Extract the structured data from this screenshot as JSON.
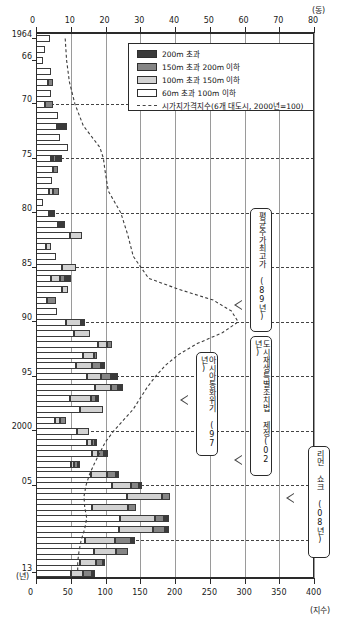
{
  "chart_data": {
    "type": "bar",
    "orientation": "horizontal",
    "title": "",
    "subtitle": "",
    "top_axis": {
      "label": "(동)",
      "ticks": [
        0,
        10,
        20,
        30,
        40,
        50,
        60,
        70,
        80
      ],
      "min": 0,
      "max": 80
    },
    "bottom_axis": {
      "label": "(지수)",
      "ticks": [
        0,
        50,
        100,
        150,
        200,
        250,
        300,
        350,
        400
      ],
      "min": 0,
      "max": 400
    },
    "ylabel": "(년)",
    "y_tick_labels": [
      "1964",
      "66",
      "70",
      "75",
      "80",
      "85",
      "90",
      "95",
      "2000",
      "05",
      "13"
    ],
    "grid": true,
    "legend_position": "top-right",
    "series": [
      {
        "name": "200m 초과",
        "key": "over200",
        "color": "#3a3a3a"
      },
      {
        "name": "150m 초과 200m 이하",
        "key": "m150_200",
        "color": "#858585"
      },
      {
        "name": "100m 초과 150m 이하",
        "key": "m100_150",
        "color": "#d2d2d2"
      },
      {
        "name": "60m 초과 100m 이하",
        "key": "m60_100",
        "color": "#ffffff"
      }
    ],
    "line_series": {
      "name": "시가지가격지수(6개 대도시, 2000년=100)",
      "style": "dashed",
      "axis": "bottom",
      "points": [
        {
          "year": 1964,
          "value": 42
        },
        {
          "year": 1966,
          "value": 44
        },
        {
          "year": 1968,
          "value": 48
        },
        {
          "year": 1970,
          "value": 56
        },
        {
          "year": 1972,
          "value": 68
        },
        {
          "year": 1974,
          "value": 92
        },
        {
          "year": 1975,
          "value": 97
        },
        {
          "year": 1976,
          "value": 99
        },
        {
          "year": 1978,
          "value": 104
        },
        {
          "year": 1980,
          "value": 122
        },
        {
          "year": 1982,
          "value": 132
        },
        {
          "year": 1984,
          "value": 140
        },
        {
          "year": 1986,
          "value": 162
        },
        {
          "year": 1987,
          "value": 205
        },
        {
          "year": 1988,
          "value": 255
        },
        {
          "year": 1989,
          "value": 281
        },
        {
          "year": 1990,
          "value": 291
        },
        {
          "year": 1991,
          "value": 268
        },
        {
          "year": 1992,
          "value": 232
        },
        {
          "year": 1993,
          "value": 205
        },
        {
          "year": 1994,
          "value": 186
        },
        {
          "year": 1995,
          "value": 172
        },
        {
          "year": 1996,
          "value": 160
        },
        {
          "year": 1997,
          "value": 150
        },
        {
          "year": 1998,
          "value": 140
        },
        {
          "year": 1999,
          "value": 126
        },
        {
          "year": 2000,
          "value": 112
        },
        {
          "year": 2001,
          "value": 100
        },
        {
          "year": 2002,
          "value": 92
        },
        {
          "year": 2003,
          "value": 84
        },
        {
          "year": 2004,
          "value": 77
        },
        {
          "year": 2005,
          "value": 72
        },
        {
          "year": 2006,
          "value": 69
        },
        {
          "year": 2007,
          "value": 70
        },
        {
          "year": 2008,
          "value": 73
        },
        {
          "year": 2009,
          "value": 70
        },
        {
          "year": 2010,
          "value": 65
        },
        {
          "year": 2011,
          "value": 62
        },
        {
          "year": 2012,
          "value": 60
        },
        {
          "year": 2013,
          "value": 60
        }
      ]
    },
    "categories": [
      1964,
      1965,
      1966,
      1967,
      1968,
      1969,
      1970,
      1971,
      1972,
      1973,
      1974,
      1975,
      1976,
      1977,
      1978,
      1979,
      1980,
      1981,
      1982,
      1983,
      1984,
      1985,
      1986,
      1987,
      1988,
      1989,
      1990,
      1991,
      1992,
      1993,
      1994,
      1995,
      1996,
      1997,
      1998,
      1999,
      2000,
      2001,
      2002,
      2003,
      2004,
      2005,
      2006,
      2007,
      2008,
      2009,
      2010,
      2011,
      2012,
      2013
    ],
    "rows": [
      {
        "year": 1964,
        "m60_100": 4.0,
        "m100_150": 0.0,
        "m150_200": 0.0,
        "over200": 0.0
      },
      {
        "year": 1965,
        "m60_100": 2.6,
        "m100_150": 0.0,
        "m150_200": 0.0,
        "over200": 0.0
      },
      {
        "year": 1966,
        "m60_100": 2.0,
        "m100_150": 0.0,
        "m150_200": 0.0,
        "over200": 0.0
      },
      {
        "year": 1967,
        "m60_100": 4.2,
        "m100_150": 0.0,
        "m150_200": 0.0,
        "over200": 0.0
      },
      {
        "year": 1968,
        "m60_100": 3.4,
        "m100_150": 0.0,
        "m150_200": 1.6,
        "over200": 0.0
      },
      {
        "year": 1969,
        "m60_100": 4.2,
        "m100_150": 0.0,
        "m150_200": 0.0,
        "over200": 0.0
      },
      {
        "year": 1970,
        "m60_100": 2.6,
        "m100_150": 0.0,
        "m150_200": 2.4,
        "over200": 0.0
      },
      {
        "year": 1971,
        "m60_100": 6.4,
        "m100_150": 0.0,
        "m150_200": 0.0,
        "over200": 0.0
      },
      {
        "year": 1972,
        "m60_100": 6.0,
        "m100_150": 0.0,
        "m150_200": 0.0,
        "over200": 2.8
      },
      {
        "year": 1973,
        "m60_100": 7.0,
        "m100_150": 0.0,
        "m150_200": 0.0,
        "over200": 0.0
      },
      {
        "year": 1974,
        "m60_100": 9.2,
        "m100_150": 0.0,
        "m150_200": 0.0,
        "over200": 0.0
      },
      {
        "year": 1975,
        "m60_100": 4.2,
        "m100_150": 0.6,
        "m150_200": 1.0,
        "over200": 1.6
      },
      {
        "year": 1976,
        "m60_100": 5.0,
        "m100_150": 0.0,
        "m150_200": 1.4,
        "over200": 0.0
      },
      {
        "year": 1977,
        "m60_100": 4.6,
        "m100_150": 0.0,
        "m150_200": 0.0,
        "over200": 0.0
      },
      {
        "year": 1978,
        "m60_100": 3.6,
        "m100_150": 1.2,
        "m150_200": 1.8,
        "over200": 0.0
      },
      {
        "year": 1979,
        "m60_100": 2.0,
        "m100_150": 0.0,
        "m150_200": 0.0,
        "over200": 0.0
      },
      {
        "year": 1980,
        "m60_100": 3.6,
        "m100_150": 0.0,
        "m150_200": 0.0,
        "over200": 2.0
      },
      {
        "year": 1981,
        "m60_100": 6.4,
        "m100_150": 0.0,
        "m150_200": 0.0,
        "over200": 2.0
      },
      {
        "year": 1982,
        "m60_100": 9.8,
        "m100_150": 3.4,
        "m150_200": 0.0,
        "over200": 0.0
      },
      {
        "year": 1983,
        "m60_100": 2.8,
        "m100_150": 1.6,
        "m150_200": 0.0,
        "over200": 0.0
      },
      {
        "year": 1984,
        "m60_100": 5.8,
        "m100_150": 0.0,
        "m150_200": 0.0,
        "over200": 0.0
      },
      {
        "year": 1985,
        "m60_100": 7.6,
        "m100_150": 4.0,
        "m150_200": 0.0,
        "over200": 0.0
      },
      {
        "year": 1986,
        "m60_100": 4.4,
        "m100_150": 2.6,
        "m150_200": 1.4,
        "over200": 1.6
      },
      {
        "year": 1987,
        "m60_100": 7.6,
        "m100_150": 1.6,
        "m150_200": 0.0,
        "over200": 0.0
      },
      {
        "year": 1988,
        "m60_100": 3.2,
        "m100_150": 0.0,
        "m150_200": 2.6,
        "over200": 0.0
      },
      {
        "year": 1989,
        "m60_100": 6.0,
        "m100_150": 0.0,
        "m150_200": 0.0,
        "over200": 0.0
      },
      {
        "year": 1990,
        "m60_100": 8.6,
        "m100_150": 4.4,
        "m150_200": 0.0,
        "over200": 1.0
      },
      {
        "year": 1991,
        "m60_100": 11.0,
        "m100_150": 4.4,
        "m150_200": 0.0,
        "over200": 0.0
      },
      {
        "year": 1992,
        "m60_100": 17.8,
        "m100_150": 2.6,
        "m150_200": 1.4,
        "over200": 0.0
      },
      {
        "year": 1993,
        "m60_100": 13.4,
        "m100_150": 3.2,
        "m150_200": 1.0,
        "over200": 0.0
      },
      {
        "year": 1994,
        "m60_100": 11.6,
        "m100_150": 4.6,
        "m150_200": 2.6,
        "over200": 1.2
      },
      {
        "year": 1995,
        "m60_100": 14.6,
        "m100_150": 4.2,
        "m150_200": 2.8,
        "over200": 2.0
      },
      {
        "year": 1996,
        "m60_100": 17.0,
        "m100_150": 4.6,
        "m150_200": 2.0,
        "over200": 1.4
      },
      {
        "year": 1997,
        "m60_100": 9.8,
        "m100_150": 6.0,
        "m150_200": 1.6,
        "over200": 0.8
      },
      {
        "year": 1998,
        "m60_100": 12.6,
        "m100_150": 6.8,
        "m150_200": 0.0,
        "over200": 0.0
      },
      {
        "year": 1999,
        "m60_100": 5.4,
        "m100_150": 1.6,
        "m150_200": 1.6,
        "over200": 0.0
      },
      {
        "year": 2000,
        "m60_100": 11.8,
        "m100_150": 3.4,
        "m150_200": 0.0,
        "over200": 0.0
      },
      {
        "year": 2001,
        "m60_100": 14.8,
        "m100_150": 1.2,
        "m150_200": 1.0,
        "over200": 0.6
      },
      {
        "year": 2002,
        "m60_100": 16.2,
        "m100_150": 1.6,
        "m150_200": 1.8,
        "over200": 1.0
      },
      {
        "year": 2003,
        "m60_100": 10.2,
        "m100_150": 0.8,
        "m150_200": 1.0,
        "over200": 0.6
      },
      {
        "year": 2004,
        "m60_100": 15.8,
        "m100_150": 4.6,
        "m150_200": 2.6,
        "over200": 0.8
      },
      {
        "year": 2005,
        "m60_100": 22.0,
        "m100_150": 5.4,
        "m150_200": 2.2,
        "over200": 1.0
      },
      {
        "year": 2006,
        "m60_100": 26.2,
        "m100_150": 10.0,
        "m150_200": 2.4,
        "over200": 0.0
      },
      {
        "year": 2007,
        "m60_100": 16.0,
        "m100_150": 10.6,
        "m150_200": 2.2,
        "over200": 0.0
      },
      {
        "year": 2008,
        "m60_100": 24.2,
        "m100_150": 10.0,
        "m150_200": 2.6,
        "over200": 1.4
      },
      {
        "year": 2009,
        "m60_100": 24.0,
        "m100_150": 9.8,
        "m150_200": 3.4,
        "over200": 1.0
      },
      {
        "year": 2010,
        "m60_100": 14.0,
        "m100_150": 8.6,
        "m150_200": 4.8,
        "over200": 1.2
      },
      {
        "year": 2011,
        "m60_100": 16.6,
        "m100_150": 6.4,
        "m150_200": 3.6,
        "over200": 0.0
      },
      {
        "year": 2012,
        "m60_100": 12.6,
        "m100_150": 4.6,
        "m150_200": 2.0,
        "over200": 0.8
      },
      {
        "year": 2013,
        "m60_100": 10.2,
        "m100_150": 3.4,
        "m150_200": 2.4,
        "over200": 1.0
      }
    ]
  },
  "legend": {
    "items": [
      {
        "label": "200m 초과"
      },
      {
        "label": "150m 초과 200m 이하"
      },
      {
        "label": "100m 초과 150m 이하"
      },
      {
        "label": "60m 초과 100m 이하"
      },
      {
        "label": "시가지가격지수(6개 대도시, 2000년=100)"
      }
    ]
  },
  "annotations": [
    {
      "id": "stock-peak",
      "text": "평균주가최고가 (89년)"
    },
    {
      "id": "urban-regen-law",
      "text": "도시재생특별조치법 제정(02년)"
    },
    {
      "id": "asia-crisis",
      "text": "아시아통화위기 (97년)"
    },
    {
      "id": "lehman-shock",
      "text": "리먼 쇼크 (08년)"
    }
  ],
  "axes": {
    "top_unit": "(동)",
    "bottom_unit": "(지수)",
    "year_unit": "(년)",
    "top_ticks": [
      "0",
      "10",
      "20",
      "30",
      "40",
      "50",
      "60",
      "70",
      "80"
    ],
    "bottom_ticks": [
      "0",
      "50",
      "100",
      "150",
      "200",
      "250",
      "300",
      "350",
      "400"
    ],
    "years": [
      "1964",
      "66",
      "70",
      "75",
      "80",
      "85",
      "90",
      "95",
      "2000",
      "05",
      "13"
    ]
  }
}
